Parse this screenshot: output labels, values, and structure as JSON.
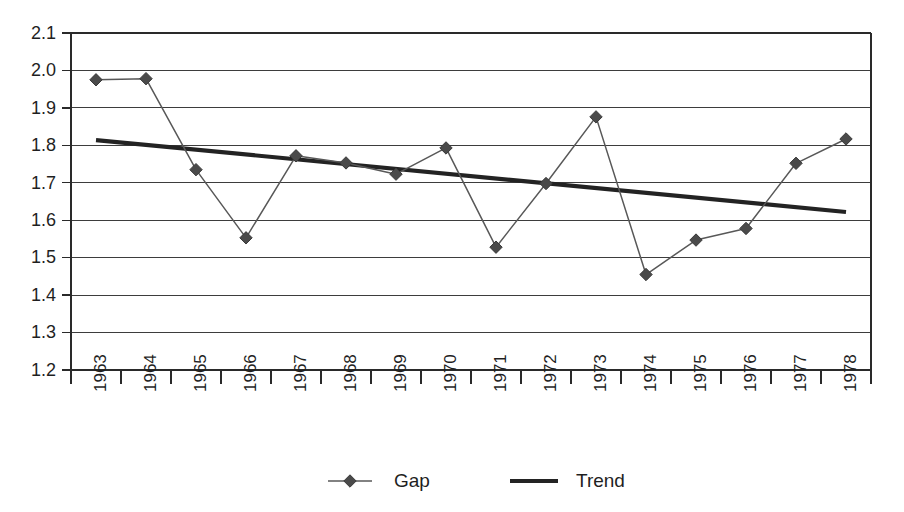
{
  "chart_data": {
    "type": "line",
    "title": "",
    "subtitle": "",
    "xlabel": "",
    "ylabel": "",
    "categories": [
      "1963",
      "1964",
      "1965",
      "1966",
      "1967",
      "1968",
      "1969",
      "1970",
      "1971",
      "1972",
      "1973",
      "1974",
      "1975",
      "1976",
      "1977",
      "1978"
    ],
    "ylim": [
      1.2,
      2.1
    ],
    "ytick_step": 0.1,
    "yticks": [
      "2.1",
      "2.0",
      "1.9",
      "1.8",
      "1.7",
      "1.6",
      "1.5",
      "1.4",
      "1.3",
      "1.2"
    ],
    "ytick_values": [
      2.1,
      2.0,
      1.9,
      1.8,
      1.7,
      1.6,
      1.5,
      1.4,
      1.3,
      1.2
    ],
    "grid": "horizontal",
    "legend_position": "bottom-center",
    "series": [
      {
        "name": "Gap",
        "marker": "diamond",
        "style": "thin-line-with-markers",
        "color": "#585858",
        "values": [
          1.975,
          1.978,
          1.735,
          1.553,
          1.772,
          1.753,
          1.723,
          1.793,
          1.528,
          1.698,
          1.876,
          1.455,
          1.547,
          1.578,
          1.752,
          1.817
        ]
      },
      {
        "name": "Trend",
        "marker": "none",
        "style": "thick-line",
        "color": "#232323",
        "endpoints": [
          {
            "x": "1963",
            "y": 1.814
          },
          {
            "x": "1978",
            "y": 1.622
          }
        ],
        "values": [
          1.814,
          1.801,
          1.788,
          1.775,
          1.763,
          1.75,
          1.737,
          1.724,
          1.711,
          1.699,
          1.686,
          1.673,
          1.66,
          1.647,
          1.635,
          1.622
        ]
      }
    ]
  },
  "legend": {
    "items": [
      {
        "label": "Gap",
        "swatch": "diamond-marker-line"
      },
      {
        "label": "Trend",
        "swatch": "thick-line"
      }
    ]
  },
  "colors": {
    "gap_series": "#585858",
    "trend_series": "#232323",
    "gridline": "#3d3d3d",
    "frame": "#2a2a2a",
    "background": "#ffffff",
    "text": "#1f1f1f"
  }
}
